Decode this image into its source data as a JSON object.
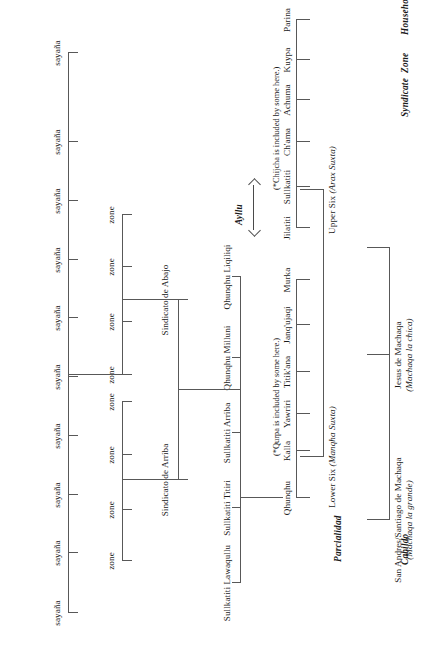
{
  "meta": {
    "orientation": "page-rotated-90-ccw",
    "line_color": "#585858",
    "text_color": "#1a1a1a"
  },
  "row_labels": [
    {
      "id": "cabildo",
      "label": "Cabildo"
    },
    {
      "id": "parcialidad",
      "label": "Parcialidad"
    },
    {
      "id": "ayllu",
      "label": "Ayllu"
    },
    {
      "id": "syndicate",
      "label": "Syndicate"
    },
    {
      "id": "zone",
      "label": "Zone"
    },
    {
      "id": "household",
      "label": "Household"
    }
  ],
  "cabildo": [
    {
      "id": "jesus",
      "name": "Jesus de Machaqa",
      "subtitle": "(Machaqa la chica)"
    },
    {
      "id": "sanandres",
      "name": "San Andres/Santiago de Machaqa",
      "subtitle": "(Machaqa la grande)"
    }
  ],
  "parcialidad": [
    {
      "id": "upper",
      "name": "Upper Six",
      "alt": "(Arax Suxta)"
    },
    {
      "id": "lower",
      "name": "Lower Six",
      "alt": "(Manqha Suxta)"
    }
  ],
  "ayllu_upper": [
    "Jilatiti",
    "Sullkatiti",
    "Ch'ama",
    "Achuma",
    "Kuypa",
    "Parina"
  ],
  "ayllu_lower": [
    "Qhunqhu",
    "Kalla",
    "Yawriri",
    "Titik'ana",
    "Janq'ujaqi",
    "Murka"
  ],
  "notes": {
    "upper_note": "(*Chijcha is included by some here.)",
    "lower_note": "(*Qurpa is included by some here.)"
  },
  "ayllu_arrow_label": "Ayllu",
  "subayllu": [
    "Sullkatiti Lawaqullu",
    "Sullkatiti Titiri",
    "Sullkatiti Arriba",
    "Qhunqhu Milluni",
    "Qhunqhu Liqiliqi"
  ],
  "syndicates": [
    {
      "id": "arriba",
      "name": "Sindicato de Arriba",
      "zone_count": 4
    },
    {
      "id": "abajo",
      "name": "Sindicato de Abajo",
      "zone_count": 4
    }
  ],
  "zone_label": "zone",
  "household_label": "sayaña",
  "zones": [
    "zone",
    "zone",
    "zone",
    "zone",
    "zone",
    "zone",
    "zone",
    "zone"
  ],
  "households": [
    "sayaña",
    "sayaña",
    "sayaña",
    "sayaña",
    "sayaña",
    "sayaña",
    "sayaña",
    "sayaña",
    "sayaña",
    "sayaña"
  ]
}
